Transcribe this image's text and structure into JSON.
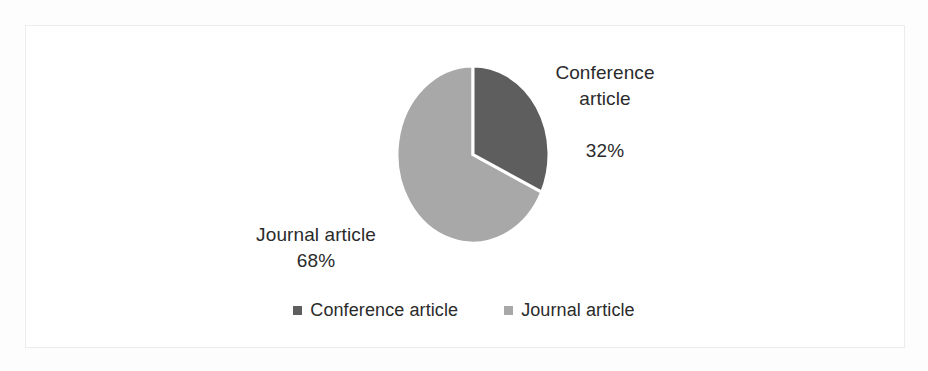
{
  "chart_data": {
    "type": "pie",
    "title": "",
    "categories": [
      "Conference article",
      "Journal article"
    ],
    "values": [
      32,
      68
    ],
    "value_unit": "%",
    "slices": [
      {
        "label": "Conference article",
        "value": 32,
        "value_text": "32%",
        "color": "#5e5e5e",
        "start_angle_deg": 0,
        "end_angle_deg": 115.2
      },
      {
        "label": "Journal article",
        "value": 68,
        "value_text": "68%",
        "color": "#a8a8a8",
        "start_angle_deg": 115.2,
        "end_angle_deg": 360
      }
    ],
    "start_angle_deg": 0,
    "direction": "clockwise",
    "data_labels": [
      {
        "name": "conference",
        "line1": "Conference",
        "line2": "article",
        "line3": "32%",
        "text": "Conference\narticle\n32%"
      },
      {
        "name": "journal",
        "line1": "Journal article",
        "line2": "68%",
        "text": "Journal article\n68%"
      }
    ],
    "legend": {
      "position": "bottom",
      "entries": [
        {
          "label": "Conference article",
          "color": "#5e5e5e"
        },
        {
          "label": "Journal article",
          "color": "#a8a8a8"
        }
      ]
    },
    "grid": false,
    "xlabel": "",
    "ylabel": "",
    "separator_color": "#ffffff",
    "background_color": "#ffffff",
    "border_color": "#ececec"
  }
}
